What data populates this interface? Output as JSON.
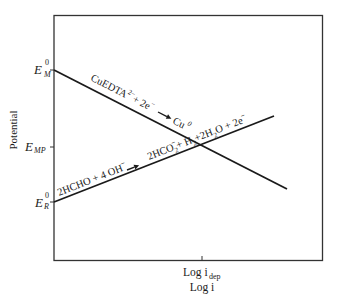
{
  "diagram": {
    "type": "mixed-potential diagram (Evans diagram)",
    "axes": {
      "y_label": "Potential",
      "x_label": "Log i",
      "x_tick_label_main": "Log i",
      "x_tick_label_sub": "dep",
      "y_ticks": [
        {
          "main": "E",
          "sup": "0",
          "sub": "M",
          "y": 70
        },
        {
          "main": "E",
          "sup": "",
          "sub": "MP",
          "y": 147
        },
        {
          "main": "E",
          "sup": "0",
          "sub": "R",
          "y": 202
        }
      ]
    },
    "lines": [
      {
        "name": "cathodic-reduction-line",
        "description": "Copper complex reduction",
        "from": [
          54,
          70
        ],
        "to": [
          287,
          189
        ],
        "label": {
          "reactant": "CuEDTA",
          "reactant_charge": "2−",
          "plus": "+ 2e",
          "electron_charge": "−",
          "product": "Cu",
          "product_sup": "0"
        }
      },
      {
        "name": "anodic-oxidation-line",
        "description": "Formaldehyde oxidation",
        "from": [
          54,
          202
        ],
        "to": [
          274,
          116
        ],
        "label": {
          "reactants": "2HCHO + 4  OH",
          "reactant_charge": "−",
          "product_1": "2HCO",
          "product_1_sub": "2",
          "product_1_sup": "−",
          "product_2": "+ H",
          "product_2_sub": "2",
          "product_3": "+2H",
          "product_3_sub": "2",
          "product_4": "O + 2e",
          "product_4_sup": "−"
        }
      }
    ],
    "intersection": {
      "x": 201,
      "y": 145,
      "x_tick": 202
    },
    "colors": {
      "line": "#1a1a1a",
      "frame": "#333333",
      "background": "#ffffff"
    }
  }
}
